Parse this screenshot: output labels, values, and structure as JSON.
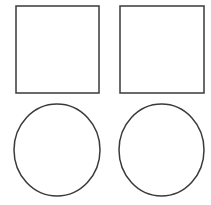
{
  "canvas": {
    "width": 211,
    "height": 205,
    "background_color": "#ffffff",
    "title": "Two squares and two circles outline diagram"
  },
  "style": {
    "stroke_color": "#3a3a3a",
    "stroke_width": 1.5,
    "fill": "none"
  },
  "shapes": [
    {
      "name": "square-top-left",
      "type": "rect",
      "label": "Square",
      "x": 16,
      "y": 6,
      "width": 83,
      "height": 87
    },
    {
      "name": "square-top-right",
      "type": "rect",
      "label": "Square",
      "x": 120,
      "y": 6,
      "width": 84,
      "height": 87
    },
    {
      "name": "circle-bottom-left",
      "type": "ellipse",
      "label": "Circle",
      "cx": 57,
      "cy": 150,
      "rx": 43,
      "ry": 46
    },
    {
      "name": "circle-bottom-right",
      "type": "ellipse",
      "label": "Circle",
      "cx": 161.5,
      "cy": 150,
      "rx": 42.5,
      "ry": 46
    }
  ]
}
